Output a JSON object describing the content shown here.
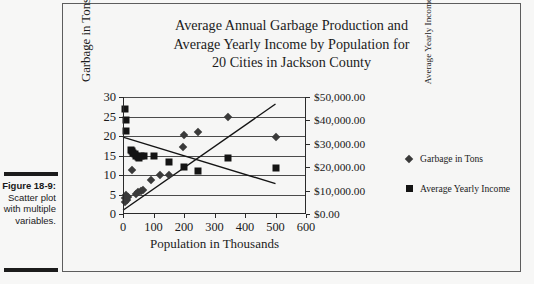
{
  "caption": {
    "figure_number": "Figure 18-9:",
    "lines": [
      "Scatter",
      "plot with",
      "multiple",
      "variables."
    ]
  },
  "chart_data": {
    "type": "scatter",
    "title": "Average Annual Garbage Production and Average Yearly Income by Population for 20 Cities in Jackson County",
    "title_lines": [
      "Average Annual Garbage Production and",
      "Average Yearly Income by Population for",
      "20 Cities in Jackson County"
    ],
    "xlabel": "Population in Thousands",
    "ylabel": "Garbage in Tons",
    "ylabel_right": "Average Yearly Income",
    "xlim": [
      0,
      600
    ],
    "ylim": [
      0,
      30
    ],
    "ylim_right": [
      0,
      50000
    ],
    "xticks": [
      0,
      100,
      200,
      300,
      400,
      500,
      600
    ],
    "xtick_labels": [
      "0",
      "100",
      "200",
      "300",
      "400",
      "500",
      "600"
    ],
    "yticks": [
      0,
      5,
      10,
      15,
      20,
      25,
      30
    ],
    "ytick_labels": [
      "0",
      "5",
      "10",
      "15",
      "20",
      "25",
      "30"
    ],
    "yticks_right": [
      0,
      10000,
      20000,
      30000,
      40000,
      50000
    ],
    "ytick_labels_right": [
      "$0.00",
      "$10,000.00",
      "$20,000.00",
      "$30,000.00",
      "$40,000.00",
      "$50,000.00"
    ],
    "grid": true,
    "grid_axis": "y",
    "legend_position": "right",
    "series": [
      {
        "name": "Garbage in Tons",
        "marker": "diamond",
        "color": "#3a3a3a",
        "axis": "left",
        "points": [
          {
            "x": 5,
            "y": 3.2
          },
          {
            "x": 8,
            "y": 4.0
          },
          {
            "x": 10,
            "y": 4.8
          },
          {
            "x": 12,
            "y": 3.6
          },
          {
            "x": 18,
            "y": 4.4
          },
          {
            "x": 30,
            "y": 11.2
          },
          {
            "x": 42,
            "y": 5.2
          },
          {
            "x": 50,
            "y": 5.6
          },
          {
            "x": 58,
            "y": 6.0
          },
          {
            "x": 66,
            "y": 6.2
          },
          {
            "x": 92,
            "y": 8.7
          },
          {
            "x": 120,
            "y": 9.9
          },
          {
            "x": 150,
            "y": 10.1
          },
          {
            "x": 198,
            "y": 17.2
          },
          {
            "x": 200,
            "y": 20.3
          },
          {
            "x": 245,
            "y": 21.1
          },
          {
            "x": 345,
            "y": 24.8
          },
          {
            "x": 500,
            "y": 19.8
          }
        ]
      },
      {
        "name": "Average Yearly Income",
        "marker": "square",
        "color": "#141414",
        "axis": "right",
        "points": [
          {
            "x": 8,
            "y": 45000
          },
          {
            "x": 9,
            "y": 40000
          },
          {
            "x": 10,
            "y": 35500
          },
          {
            "x": 26,
            "y": 27500
          },
          {
            "x": 30,
            "y": 27000
          },
          {
            "x": 34,
            "y": 26000
          },
          {
            "x": 38,
            "y": 25500
          },
          {
            "x": 42,
            "y": 25000
          },
          {
            "x": 48,
            "y": 24500
          },
          {
            "x": 52,
            "y": 24000
          },
          {
            "x": 58,
            "y": 25000
          },
          {
            "x": 70,
            "y": 25000
          },
          {
            "x": 100,
            "y": 25000
          },
          {
            "x": 150,
            "y": 22300
          },
          {
            "x": 200,
            "y": 20200
          },
          {
            "x": 245,
            "y": 18400
          },
          {
            "x": 345,
            "y": 24000
          },
          {
            "x": 500,
            "y": 19700
          }
        ]
      }
    ],
    "trendlines": [
      {
        "name": "garbage-trend",
        "axis": "left",
        "x0": 0,
        "y0": 19.7,
        "x1": 500,
        "y1": 7.8
      },
      {
        "name": "income-trend",
        "axis": "right",
        "x0": 0,
        "y0": 1600,
        "x1": 500,
        "y1": 47000
      }
    ]
  }
}
